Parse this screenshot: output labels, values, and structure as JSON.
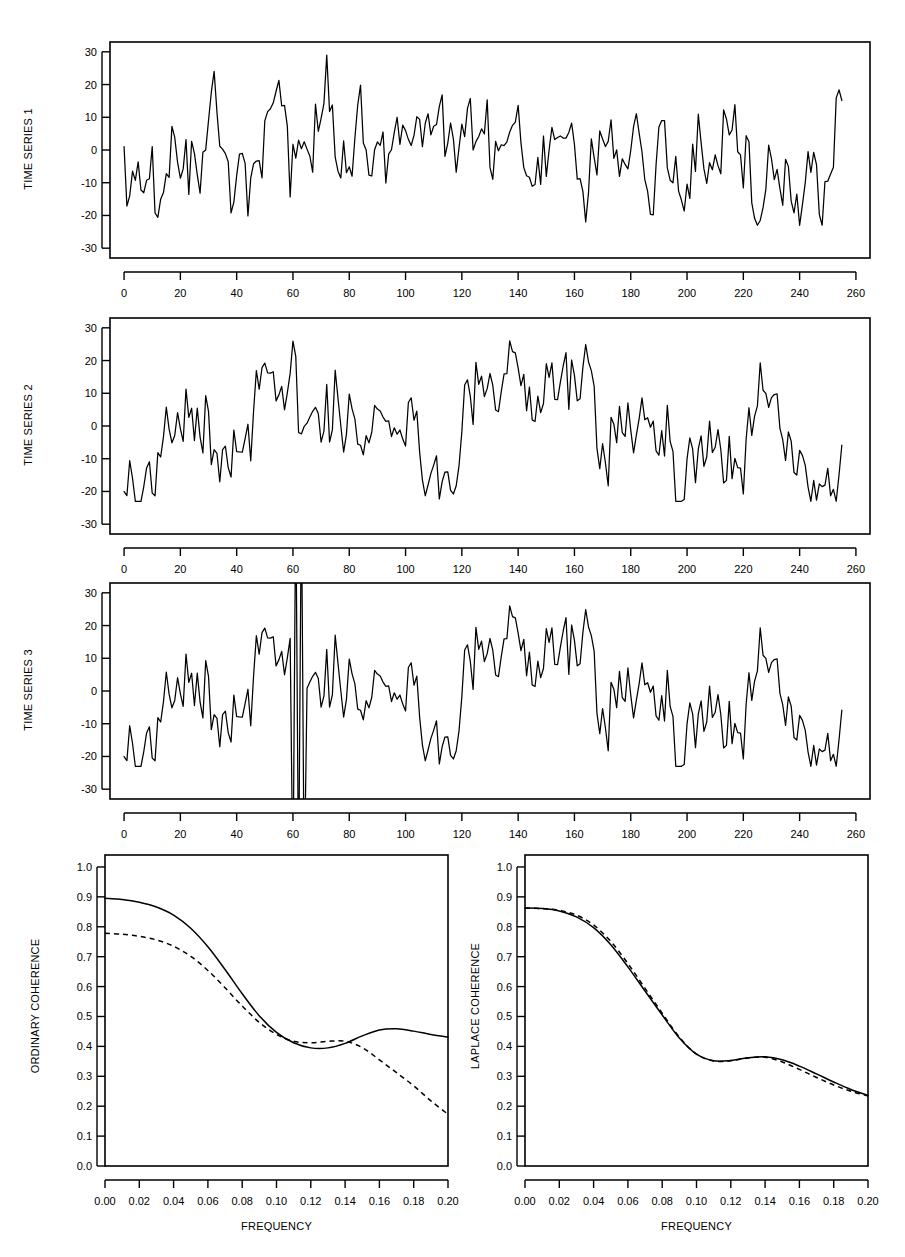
{
  "figure": {
    "panels": [
      {
        "id": "time-series-1",
        "ylabel": "TIME SERIES 1",
        "xlabel": "",
        "yticks": [
          30,
          20,
          10,
          0,
          -10,
          -20,
          -30
        ],
        "ytick_labels": [
          "30",
          "20",
          "10",
          "0",
          "-10",
          "-20",
          "-30"
        ],
        "xticks": [
          0,
          20,
          40,
          60,
          80,
          100,
          120,
          140,
          160,
          180,
          200,
          220,
          240,
          260
        ],
        "xtick_labels": [
          "0",
          "20",
          "40",
          "60",
          "80",
          "100",
          "120",
          "140",
          "160",
          "180",
          "200",
          "220",
          "240",
          "260"
        ]
      },
      {
        "id": "time-series-2",
        "ylabel": "TIME SERIES 2",
        "xlabel": "",
        "yticks": [
          30,
          20,
          10,
          0,
          -10,
          -20,
          -30
        ],
        "ytick_labels": [
          "30",
          "20",
          "10",
          "0",
          "-10",
          "-20",
          "-30"
        ],
        "xticks": [
          0,
          20,
          40,
          60,
          80,
          100,
          120,
          140,
          160,
          180,
          200,
          220,
          240,
          260
        ],
        "xtick_labels": [
          "0",
          "20",
          "40",
          "60",
          "80",
          "100",
          "120",
          "140",
          "160",
          "180",
          "200",
          "220",
          "240",
          "260"
        ]
      },
      {
        "id": "time-series-3",
        "ylabel": "TIME SERIES 3",
        "xlabel": "",
        "yticks": [
          30,
          20,
          10,
          0,
          -10,
          -20,
          -30
        ],
        "ytick_labels": [
          "30",
          "20",
          "10",
          "0",
          "-10",
          "-20",
          "-30"
        ],
        "xticks": [
          0,
          20,
          40,
          60,
          80,
          100,
          120,
          140,
          160,
          180,
          200,
          220,
          240,
          260
        ],
        "xtick_labels": [
          "0",
          "20",
          "40",
          "60",
          "80",
          "100",
          "120",
          "140",
          "160",
          "180",
          "200",
          "220",
          "240",
          "260"
        ]
      },
      {
        "id": "ordinary-coherence",
        "ylabel": "ORDINARY COHERENCE",
        "xlabel": "FREQUENCY",
        "yticks": [
          1.0,
          0.9,
          0.8,
          0.7,
          0.6,
          0.5,
          0.4,
          0.3,
          0.2,
          0.1,
          0.0
        ],
        "ytick_labels": [
          "1.0",
          "0.9",
          "0.8",
          "0.7",
          "0.6",
          "0.5",
          "0.4",
          "0.3",
          "0.2",
          "0.1",
          "0.0"
        ],
        "xticks": [
          0.0,
          0.02,
          0.04,
          0.06,
          0.08,
          0.1,
          0.12,
          0.14,
          0.16,
          0.18,
          0.2
        ],
        "xtick_labels": [
          "0.00",
          "0.02",
          "0.04",
          "0.06",
          "0.08",
          "0.10",
          "0.12",
          "0.14",
          "0.16",
          "0.18",
          "0.20"
        ]
      },
      {
        "id": "laplace-coherence",
        "ylabel": "LAPLACE COHERENCE",
        "xlabel": "FREQUENCY",
        "yticks": [
          1.0,
          0.9,
          0.8,
          0.7,
          0.6,
          0.5,
          0.4,
          0.3,
          0.2,
          0.1,
          0.0
        ],
        "ytick_labels": [
          "1.0",
          "0.9",
          "0.8",
          "0.7",
          "0.6",
          "0.5",
          "0.4",
          "0.3",
          "0.2",
          "0.1",
          "0.0"
        ],
        "xticks": [
          0.0,
          0.02,
          0.04,
          0.06,
          0.08,
          0.1,
          0.12,
          0.14,
          0.16,
          0.18,
          0.2
        ],
        "xtick_labels": [
          "0.00",
          "0.02",
          "0.04",
          "0.06",
          "0.08",
          "0.10",
          "0.12",
          "0.14",
          "0.16",
          "0.18",
          "0.20"
        ]
      }
    ]
  },
  "chart_data": [
    {
      "type": "line",
      "id": "time-series-1",
      "title": "",
      "xlabel": "",
      "ylabel": "TIME SERIES 1",
      "xlim": [
        -5,
        265
      ],
      "ylim": [
        -33,
        33
      ],
      "grid": false,
      "legend": "none",
      "n": 256,
      "generator": {
        "kind": "seeded-ar-noise",
        "seed": 20117,
        "ar_coef": 0.62,
        "noise_sd": 6.2,
        "trend_anchors_x": [
          0,
          8,
          20,
          35,
          48,
          62,
          70,
          85,
          100,
          112,
          125,
          140,
          152,
          165,
          180,
          195,
          210,
          225,
          240,
          252,
          256
        ],
        "trend_anchors_y": [
          -12,
          -16,
          -3,
          -10,
          1,
          6,
          12,
          0,
          2,
          -7,
          2,
          14,
          3,
          -5,
          0,
          -3,
          -2,
          -4,
          -6,
          2,
          20
        ]
      },
      "notes": "Stationary-looking series oscillating mostly between -22 and 28; local maximum near t=140 at about 28, sharp terminal rise to about 22 at t=256.",
      "observed_extremes": {
        "min": -22,
        "max": 28,
        "min_at_t": 6,
        "max_at_t": 140
      }
    },
    {
      "type": "line",
      "id": "time-series-2",
      "title": "",
      "xlabel": "",
      "ylabel": "TIME SERIES 2",
      "xlim": [
        -5,
        265
      ],
      "ylim": [
        -33,
        33
      ],
      "grid": false,
      "legend": "none",
      "n": 256,
      "generator": {
        "kind": "seeded-ar-noise",
        "seed": 50849,
        "ar_coef": 0.58,
        "noise_sd": 6.6,
        "trend_anchors_x": [
          0,
          6,
          14,
          22,
          32,
          42,
          52,
          62,
          72,
          84,
          96,
          108,
          120,
          132,
          142,
          152,
          162,
          172,
          184,
          196,
          208,
          220,
          232,
          244,
          252,
          256
        ],
        "trend_anchors_y": [
          -9,
          -16,
          -4,
          -2,
          -12,
          -2,
          2,
          -6,
          6,
          -2,
          -6,
          -10,
          0,
          12,
          16,
          10,
          12,
          -2,
          -8,
          -10,
          -4,
          -6,
          -4,
          -8,
          -2,
          14
        ]
      },
      "notes": "Similar variance to series 1; broad elevated region between t=130 and t=165 peaking near 25, lower plateau near t=185-200, terminal rise to about 16.",
      "observed_extremes": {
        "min": -22,
        "max": 25,
        "min_at_t": 5,
        "max_at_t": 141
      }
    },
    {
      "type": "line",
      "id": "time-series-3",
      "title": "",
      "xlabel": "",
      "ylabel": "TIME SERIES 3",
      "xlim": [
        -5,
        265
      ],
      "ylim": [
        -33,
        33
      ],
      "grid": false,
      "legend": "none",
      "n": 256,
      "base_series": "time-series-2",
      "outliers": [
        {
          "t": 60,
          "value": -60,
          "clipped": true,
          "direction": "down"
        },
        {
          "t": 61,
          "value": 60,
          "clipped": true,
          "direction": "up"
        },
        {
          "t": 62,
          "value": -60,
          "clipped": true,
          "direction": "down"
        },
        {
          "t": 63,
          "value": 60,
          "clipped": true,
          "direction": "up"
        },
        {
          "t": 64,
          "value": -60,
          "clipped": true,
          "direction": "down"
        }
      ],
      "notes": "Identical to TIME SERIES 2 except for contaminating outliers near t=60-64 that run off the top and bottom of the plotting frame, drawn as narrow vertical spikes.",
      "observed_extremes": {
        "min": -22,
        "max": 25
      }
    },
    {
      "type": "line",
      "id": "ordinary-coherence",
      "title": "",
      "xlabel": "FREQUENCY",
      "ylabel": "ORDINARY COHERENCE",
      "xlim": [
        0.0,
        0.2
      ],
      "ylim": [
        0.0,
        1.04
      ],
      "grid": false,
      "legend": "none",
      "x": [
        0.0,
        0.01,
        0.02,
        0.03,
        0.04,
        0.05,
        0.06,
        0.07,
        0.08,
        0.09,
        0.1,
        0.11,
        0.12,
        0.13,
        0.14,
        0.15,
        0.16,
        0.17,
        0.18,
        0.19,
        0.2
      ],
      "series": [
        {
          "name": "solid",
          "style": "solid",
          "values": [
            0.895,
            0.891,
            0.882,
            0.866,
            0.839,
            0.795,
            0.733,
            0.657,
            0.576,
            0.502,
            0.447,
            0.412,
            0.395,
            0.395,
            0.41,
            0.435,
            0.455,
            0.459,
            0.451,
            0.44,
            0.431
          ]
        },
        {
          "name": "dashed",
          "style": "dashed",
          "values": [
            0.778,
            0.775,
            0.768,
            0.756,
            0.735,
            0.701,
            0.654,
            0.596,
            0.535,
            0.48,
            0.44,
            0.417,
            0.412,
            0.417,
            0.417,
            0.396,
            0.355,
            0.312,
            0.268,
            0.218,
            0.173
          ]
        }
      ],
      "notes": "Solid curve starts near 0.895 and dashed near 0.778; both fall to a trough near f=0.12, solid rises to a local maximum about 0.46 near f=0.165 then settles at 0.43, dashed decays steadily to about 0.17 at f=0.20."
    },
    {
      "type": "line",
      "id": "laplace-coherence",
      "title": "",
      "xlabel": "FREQUENCY",
      "ylabel": "LAPLACE COHERENCE",
      "xlim": [
        0.0,
        0.2
      ],
      "ylim": [
        0.0,
        1.04
      ],
      "grid": false,
      "legend": "none",
      "x": [
        0.0,
        0.01,
        0.02,
        0.03,
        0.04,
        0.05,
        0.06,
        0.07,
        0.08,
        0.09,
        0.1,
        0.11,
        0.12,
        0.13,
        0.14,
        0.15,
        0.16,
        0.17,
        0.18,
        0.19,
        0.2
      ],
      "series": [
        {
          "name": "solid",
          "style": "solid",
          "values": [
            0.863,
            0.861,
            0.853,
            0.833,
            0.797,
            0.74,
            0.666,
            0.585,
            0.505,
            0.428,
            0.374,
            0.352,
            0.353,
            0.362,
            0.365,
            0.355,
            0.334,
            0.308,
            0.281,
            0.256,
            0.236
          ]
        },
        {
          "name": "dashed",
          "style": "dashed",
          "values": [
            0.862,
            0.861,
            0.855,
            0.839,
            0.806,
            0.751,
            0.677,
            0.594,
            0.511,
            0.431,
            0.374,
            0.351,
            0.352,
            0.361,
            0.364,
            0.348,
            0.323,
            0.296,
            0.271,
            0.25,
            0.234
          ]
        }
      ],
      "notes": "Solid and dashed curves nearly coincide, starting about 0.863, falling to a trough near 0.35 around f=0.11, a small bump to about 0.365 near f=0.135, then decaying together to about 0.235 at f=0.20; the dashed lies marginally below the solid from f=0.145 onward."
    }
  ]
}
